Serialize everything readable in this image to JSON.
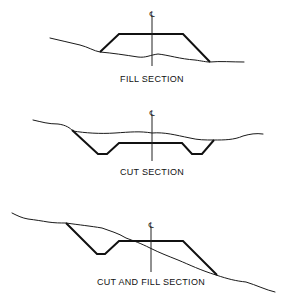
{
  "figure": {
    "panels": [
      {
        "id": "fill",
        "label": "FILL SECTION",
        "centerline_symbol": "℄"
      },
      {
        "id": "cut",
        "label": "CUT SECTION",
        "centerline_symbol": "℄"
      },
      {
        "id": "cut-and-fill",
        "label": "CUT AND FILL SECTION",
        "centerline_symbol": "℄"
      }
    ],
    "colors": {
      "line": "#111111",
      "background": "#ffffff"
    }
  }
}
